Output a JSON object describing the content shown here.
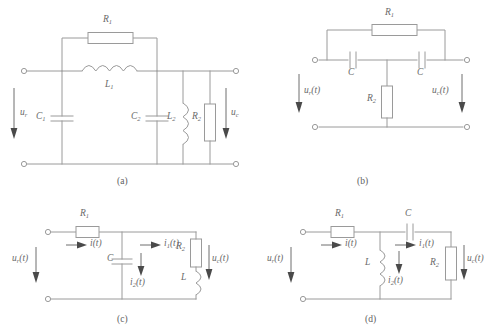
{
  "figure": {
    "line_color": "#9a9a9a",
    "text_color": "#6a6a6a",
    "background_color": "#ffffff"
  },
  "panels": [
    {
      "id": "a",
      "caption": "(a)",
      "input_label": "u",
      "input_sub": "r",
      "output_label": "u",
      "output_sub": "c",
      "components": [
        {
          "name": "R1",
          "type": "resistor",
          "label": "R",
          "sub": "1"
        },
        {
          "name": "L1",
          "type": "inductor",
          "label": "L",
          "sub": "1"
        },
        {
          "name": "C1",
          "type": "capacitor",
          "label": "C",
          "sub": "1"
        },
        {
          "name": "C2",
          "type": "capacitor",
          "label": "C",
          "sub": "2"
        },
        {
          "name": "L2",
          "type": "inductor",
          "label": "L",
          "sub": "2"
        },
        {
          "name": "R2",
          "type": "resistor",
          "label": "R",
          "sub": "2"
        }
      ]
    },
    {
      "id": "b",
      "caption": "(b)",
      "input_label": "u",
      "input_sub": "r",
      "input_arg": "(t)",
      "output_label": "u",
      "output_sub": "c",
      "output_arg": "(t)",
      "components": [
        {
          "name": "R1",
          "type": "resistor",
          "label": "R",
          "sub": "1"
        },
        {
          "name": "C-left",
          "type": "capacitor",
          "label": "C",
          "sub": ""
        },
        {
          "name": "C-right",
          "type": "capacitor",
          "label": "C",
          "sub": ""
        },
        {
          "name": "R2",
          "type": "resistor",
          "label": "R",
          "sub": "2"
        }
      ]
    },
    {
      "id": "c",
      "caption": "(c)",
      "input_label": "u",
      "input_sub": "r",
      "input_arg": "(t)",
      "output_label": "u",
      "output_sub": "c",
      "output_arg": "(t)",
      "components": [
        {
          "name": "R1",
          "type": "resistor",
          "label": "R",
          "sub": "1"
        },
        {
          "name": "C",
          "type": "capacitor",
          "label": "C",
          "sub": ""
        },
        {
          "name": "R2",
          "type": "resistor",
          "label": "R",
          "sub": "2"
        },
        {
          "name": "L",
          "type": "inductor",
          "label": "L",
          "sub": ""
        }
      ],
      "currents": [
        {
          "name": "i",
          "label": "i",
          "sub": "",
          "arg": "(t)"
        },
        {
          "name": "i1",
          "label": "i",
          "sub": "1",
          "arg": "(t)"
        },
        {
          "name": "i2",
          "label": "i",
          "sub": "2",
          "arg": "(t)"
        }
      ]
    },
    {
      "id": "d",
      "caption": "(d)",
      "input_label": "u",
      "input_sub": "r",
      "input_arg": "(t)",
      "output_label": "u",
      "output_sub": "c",
      "output_arg": "(t)",
      "components": [
        {
          "name": "R1",
          "type": "resistor",
          "label": "R",
          "sub": "1"
        },
        {
          "name": "C",
          "type": "capacitor",
          "label": "C",
          "sub": ""
        },
        {
          "name": "L",
          "type": "inductor",
          "label": "L",
          "sub": ""
        },
        {
          "name": "R2",
          "type": "resistor",
          "label": "R",
          "sub": "2"
        }
      ],
      "currents": [
        {
          "name": "i",
          "label": "i",
          "sub": "",
          "arg": "(t)"
        },
        {
          "name": "i1",
          "label": "i",
          "sub": "1",
          "arg": "(t)"
        },
        {
          "name": "i2",
          "label": "i",
          "sub": "2",
          "arg": "(t)"
        }
      ]
    }
  ],
  "labels": {
    "a": {
      "R1": "R",
      "R1_sub": "1",
      "L1": "L",
      "L1_sub": "1",
      "C1": "C",
      "C1_sub": "1",
      "C2": "C",
      "C2_sub": "2",
      "L2": "L",
      "L2_sub": "2",
      "R2": "R",
      "R2_sub": "2",
      "ur": "u",
      "ur_sub": "r",
      "uc": "u",
      "uc_sub": "c",
      "caption": "(a)"
    },
    "b": {
      "R1": "R",
      "R1_sub": "1",
      "Cl": "C",
      "Cr": "C",
      "R2": "R",
      "R2_sub": "2",
      "ur": "u",
      "ur_sub": "r",
      "ur_arg": "(t)",
      "uc": "u",
      "uc_sub": "c",
      "uc_arg": "(t)",
      "caption": "(b)"
    },
    "c": {
      "R1": "R",
      "R1_sub": "1",
      "C": "C",
      "R2": "R",
      "R2_sub": "2",
      "L": "L",
      "i": "i",
      "i_arg": "(t)",
      "i1": "i",
      "i1_sub": "1",
      "i1_arg": "(t)",
      "i2": "i",
      "i2_sub": "2",
      "i2_arg": "(t)",
      "ur": "u",
      "ur_sub": "r",
      "ur_arg": "(t)",
      "uc": "u",
      "uc_sub": "c",
      "uc_arg": "(t)",
      "caption": "(c)"
    },
    "d": {
      "R1": "R",
      "R1_sub": "1",
      "C": "C",
      "L": "L",
      "R2": "R",
      "R2_sub": "2",
      "i": "i",
      "i_arg": "(t)",
      "i1": "i",
      "i1_sub": "1",
      "i1_arg": "(t)",
      "i2": "i",
      "i2_sub": "2",
      "i2_arg": "(t)",
      "ur": "u",
      "ur_sub": "r",
      "ur_arg": "(t)",
      "uc": "u",
      "uc_sub": "c",
      "uc_arg": "(t)",
      "caption": "(d)"
    }
  }
}
